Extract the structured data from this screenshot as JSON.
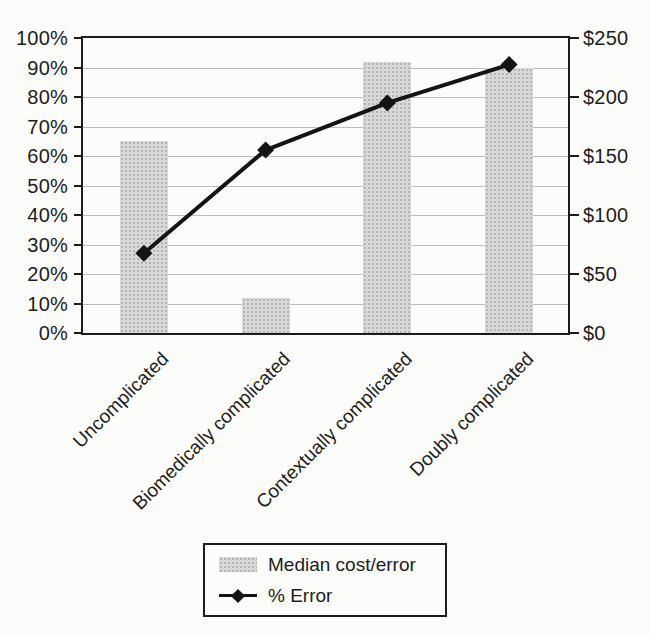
{
  "chart_data": {
    "type": "bar+line combo",
    "categories": [
      "Uncomplicated",
      "Biomedically complicated",
      "Contextually complicated",
      "Doubly complicated"
    ],
    "series": [
      {
        "name": "Median cost/error",
        "chart_type": "bar",
        "axis": "right",
        "unit": "$",
        "values": [
          163,
          30,
          230,
          225
        ],
        "percent_of_axis": [
          65,
          12,
          92,
          90
        ]
      },
      {
        "name": "% Error",
        "chart_type": "line",
        "axis": "left",
        "unit": "%",
        "values": [
          27,
          62,
          78,
          91
        ]
      }
    ],
    "left_axis": {
      "min": 0,
      "max": 100,
      "tick_step": 10,
      "tick_labels": [
        "0%",
        "10%",
        "20%",
        "30%",
        "40%",
        "50%",
        "60%",
        "70%",
        "80%",
        "90%",
        "100%"
      ]
    },
    "right_axis": {
      "min": 0,
      "max": 250,
      "tick_step": 50,
      "tick_labels": [
        "$0",
        "$50",
        "$100",
        "$150",
        "$200",
        "$250"
      ]
    },
    "grid": "horizontal gridlines at every 10%",
    "legend_position": "bottom",
    "title": "",
    "xlabel": "",
    "ylabel_left": "",
    "ylabel_right": "",
    "colors": {
      "bar_fill": "#d8d8d8",
      "bar_speckle": "#b5b5b5",
      "line": "#141414",
      "grid": "#bdbdbd",
      "axis": "#1c1c1c",
      "text": "#1d1d1d",
      "background": "#fcfcfa"
    }
  },
  "legend": {
    "items": [
      {
        "label": "Median cost/error",
        "marker": "bar-swatch"
      },
      {
        "label": "% Error",
        "marker": "line-diamond"
      }
    ]
  }
}
